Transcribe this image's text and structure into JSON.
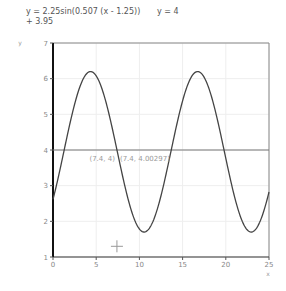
{
  "legend": {
    "series1": "y = 2.25sin(0.507 (x - 1.25)) + 3.95",
    "series2": "y = 4"
  },
  "annotations": {
    "point1": "(7.4, 4)",
    "point2": "(7.4, 4.00297)"
  },
  "chart_data": {
    "type": "line",
    "title": "",
    "xlabel": "x",
    "ylabel": "y",
    "xlim": [
      0,
      25
    ],
    "ylim": [
      1,
      7
    ],
    "xticks": [
      0,
      5,
      10,
      15,
      20,
      25
    ],
    "yticks": [
      1,
      2,
      3,
      4,
      5,
      6,
      7
    ],
    "grid": true,
    "series": [
      {
        "name": "y = 2.25sin(0.507 (x - 1.25)) + 3.95",
        "amplitude": 2.25,
        "frequency": 0.507,
        "phase_shift": 1.25,
        "offset": 3.95,
        "color": "#444444"
      },
      {
        "name": "y = 4",
        "constant": 4,
        "color": "#777777"
      }
    ],
    "annotations": [
      {
        "x": 7.4,
        "y": 4,
        "label": "(7.4, 4)"
      },
      {
        "x": 7.4,
        "y": 4.00297,
        "label": "(7.4, 4.00297)"
      }
    ],
    "cursor": {
      "x": 7.4,
      "y": 1.3
    }
  }
}
